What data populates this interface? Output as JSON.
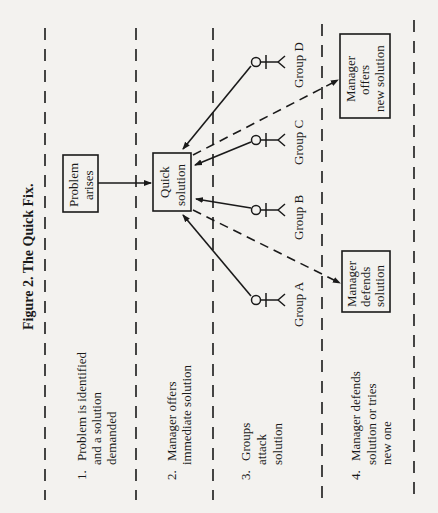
{
  "figure": {
    "title": "Figure 2. The Quick Fix.",
    "orientation": "rotated 90° counter-clockwise"
  },
  "stages": [
    {
      "number": "1.",
      "lines": [
        "Problem is identified",
        "and a solution",
        "demanded"
      ]
    },
    {
      "number": "2.",
      "lines": [
        "Manager offers",
        "immediate solution"
      ]
    },
    {
      "number": "3.",
      "lines": [
        "Groups",
        "attack",
        "solution"
      ]
    },
    {
      "number": "4.",
      "lines": [
        "Manager defends",
        "solution or tries",
        "new one"
      ]
    }
  ],
  "boxes": {
    "problem": [
      "Problem",
      "arises"
    ],
    "quick_solution": [
      "Quick",
      "solution"
    ],
    "manager_defends": [
      "Manager",
      "defends",
      "solution"
    ],
    "manager_offers": [
      "Manager",
      "offers",
      "new solution"
    ]
  },
  "groups": [
    "Group A",
    "Group B",
    "Group C",
    "Group D"
  ],
  "edges": [
    {
      "from": "Problem arises",
      "to": "Quick solution",
      "style": "solid"
    },
    {
      "from": "Group A",
      "to": "Quick solution",
      "style": "solid"
    },
    {
      "from": "Group B",
      "to": "Quick solution",
      "style": "solid"
    },
    {
      "from": "Group C",
      "to": "Quick solution",
      "style": "solid"
    },
    {
      "from": "Group D",
      "to": "Quick solution",
      "style": "solid"
    },
    {
      "from": "Quick solution",
      "to": "Manager defends solution",
      "style": "dashed"
    },
    {
      "from": "Quick solution",
      "to": "Manager offers new solution",
      "style": "dashed"
    }
  ]
}
